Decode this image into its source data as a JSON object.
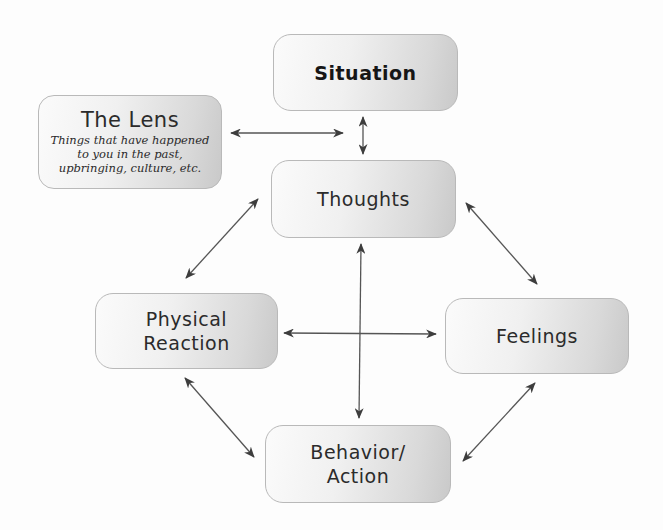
{
  "diagram": {
    "nodes": {
      "situation": {
        "title": "Situation"
      },
      "lens": {
        "title": "The Lens",
        "subtitle_lines": [
          "Things that have happened",
          "to you in the past,",
          "upbringing, culture, etc."
        ]
      },
      "thoughts": {
        "title": "Thoughts"
      },
      "physical": {
        "title_lines": [
          "Physical",
          "Reaction"
        ]
      },
      "feelings": {
        "title": "Feelings"
      },
      "behavior": {
        "title_lines": [
          "Behavior/",
          "Action"
        ]
      }
    },
    "edges": [
      {
        "from": "lens",
        "to": "situation-thoughts-link",
        "type": "bidirectional"
      },
      {
        "from": "situation",
        "to": "thoughts",
        "type": "bidirectional"
      },
      {
        "from": "thoughts",
        "to": "physical",
        "type": "bidirectional"
      },
      {
        "from": "thoughts",
        "to": "feelings",
        "type": "bidirectional"
      },
      {
        "from": "thoughts",
        "to": "behavior",
        "type": "bidirectional"
      },
      {
        "from": "physical",
        "to": "feelings",
        "type": "bidirectional"
      },
      {
        "from": "physical",
        "to": "behavior",
        "type": "bidirectional"
      },
      {
        "from": "feelings",
        "to": "behavior",
        "type": "bidirectional"
      }
    ],
    "colors": {
      "box_border": "#b9b9b9",
      "box_light": "#fbfbfb",
      "box_dark": "#c9c9c9",
      "arrow": "#555555",
      "text": "#2b2b2b"
    }
  }
}
